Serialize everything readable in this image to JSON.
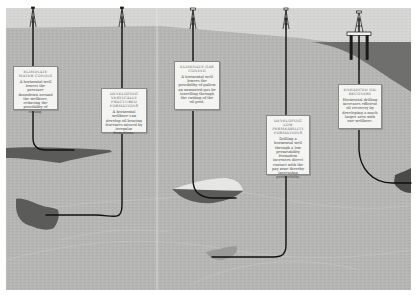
{
  "diagram": {
    "colors": {
      "sky": "#d9d9d7",
      "ground": "#b4b4b2",
      "water": "#6f706e",
      "reservoir_dark": "#5b5c5a",
      "gas_cap": "#e6e6e4",
      "wellbore": "#111111",
      "callout_bg": "#f4f4f2"
    },
    "callouts": [
      {
        "id": "water-coning",
        "title": "Eliminate water coning",
        "body": "A horizontal well lowers the pressure drawdown around the wellbore, reducing the possibility of coning."
      },
      {
        "id": "vertical-fractures",
        "title": "Developing vertically fractured formations",
        "body": "A horizontal wellbore can develop oil bearing fractures missed by irregular formations."
      },
      {
        "id": "gas-coning",
        "title": "Eliminate gas coning",
        "body": "A horizontal well lowers the possibility of gallow an unwanted gas be travelling through the cutting of the oil pool."
      },
      {
        "id": "low-permeability",
        "title": "Developing low permeability formations",
        "body": "Drilling a horizontal well through a low permeability formation increases direct contact with the pay zone thereby increasing productivity."
      },
      {
        "id": "enhanced-recovery",
        "title": "Enhanced oil recovery",
        "body": "Horizontal drilling increases efficient oil recovery by developing a much larger area with one wellbore."
      }
    ],
    "wells": [
      {
        "id": "well-1",
        "type": "land-rig"
      },
      {
        "id": "well-2",
        "type": "land-rig"
      },
      {
        "id": "well-3",
        "type": "land-rig"
      },
      {
        "id": "well-4",
        "type": "land-rig"
      },
      {
        "id": "well-5",
        "type": "offshore-platform"
      }
    ]
  }
}
